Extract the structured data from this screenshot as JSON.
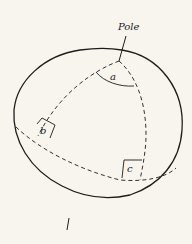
{
  "diagram": {
    "labels": {
      "pole": "Pole",
      "angle_a": "a",
      "angle_b": "b",
      "angle_c": "c"
    },
    "colors": {
      "background": "#f7f5ee",
      "stroke": "#1c1c1c"
    }
  }
}
